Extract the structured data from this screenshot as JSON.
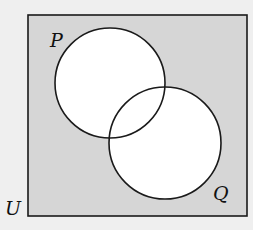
{
  "diagram": {
    "type": "venn",
    "universe_label": "U",
    "sets": [
      {
        "label": "P",
        "cx": 110,
        "cy": 83,
        "r": 55
      },
      {
        "label": "Q",
        "cx": 165,
        "cy": 143,
        "r": 56
      }
    ],
    "shaded_region": "complement of P union Q",
    "colors": {
      "background": "#efefef",
      "shade": "#d6d6d6",
      "circle_fill": "#ffffff",
      "stroke": "#1a1a1a"
    }
  }
}
